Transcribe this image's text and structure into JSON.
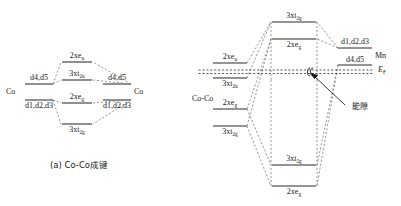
{
  "figure": {
    "caption_a": "(a) Co-Co成键",
    "fermi_label": "E",
    "fermi_sub": "F",
    "gap_annotation": "能隙"
  },
  "left_diagram": {
    "name": "Co-Co bonding molecular orbital diagram",
    "left_atom": "Co",
    "right_atom": "Co",
    "left_atom_upper_level": "d4,d5",
    "left_atom_lower_level": "d1,d2,d3",
    "right_atom_upper_level": "d4,d5",
    "right_atom_lower_level": "d1,d2,d3",
    "center_levels": [
      {
        "label": "2xe",
        "sub": "u"
      },
      {
        "label": "3xt",
        "sub": "2u"
      },
      {
        "label": "2xe",
        "sub": "g"
      },
      {
        "label": "3xt",
        "sub": "2g"
      }
    ]
  },
  "right_diagram": {
    "name": "Co-Mn bonding molecular orbital diagram",
    "left_atom": "Co-Co",
    "right_atom": "Mn",
    "left_levels": [
      {
        "label": "2xe",
        "sub": "u"
      },
      {
        "label": "3xt",
        "sub": "2u"
      },
      {
        "label": "2xe",
        "sub": "g"
      },
      {
        "label": "3xt",
        "sub": "2g"
      }
    ],
    "right_atom_upper_level": "d1,d2,d3",
    "right_atom_lower_level": "d4,d5",
    "center_upper_levels": [
      {
        "label": "3xt",
        "sub": "2g"
      },
      {
        "label": "2xe",
        "sub": "g"
      }
    ],
    "center_lower_levels": [
      {
        "label": "3xt",
        "sub": "2g"
      },
      {
        "label": "2xe",
        "sub": "g"
      }
    ]
  },
  "colors": {
    "line": "#2b2b2b",
    "dashed": "#6a6a6a",
    "text": "#1a1a1a"
  }
}
